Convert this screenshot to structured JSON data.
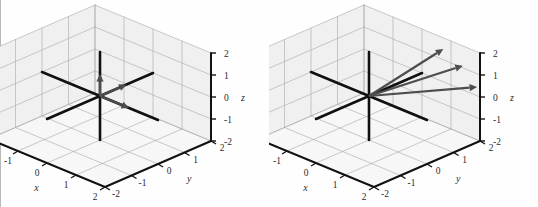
{
  "figure": {
    "background_color": "#fefefe",
    "panel_count": 2,
    "left_rule_color": "#b9b9b9"
  },
  "chart_data": [
    {
      "type": "scatter",
      "title": "",
      "subtitle": "",
      "projection": "3d",
      "panel_label": "left",
      "xlabel": "x",
      "ylabel": "y",
      "zlabel": "z",
      "xlim": [
        -2,
        2
      ],
      "ylim": [
        -2,
        2
      ],
      "zlim": [
        -2,
        2
      ],
      "xticks": [
        "-2",
        "-1",
        "0",
        "1",
        "2"
      ],
      "yticks": [
        "2",
        "1",
        "0",
        "-1",
        "-2"
      ],
      "zticks": [
        "2",
        "1",
        "0",
        "-1",
        "-2"
      ],
      "grid": true,
      "legend": "none",
      "axis_color": "#000000",
      "grid_color": "#b0b0b0",
      "pane_color": "#f0f0f0",
      "vector_color": "#4d4d4d",
      "axis_line_color": "#111111",
      "annotations": [
        "three short vectors drawn from the origin",
        "drawn axes lines for x, y and z through the origin"
      ],
      "vectors": [
        {
          "name": "vector-1",
          "start": [
            0,
            0,
            0
          ],
          "end": [
            0,
            0,
            1
          ],
          "label": ""
        },
        {
          "name": "vector-2",
          "start": [
            0,
            0,
            0
          ],
          "end": [
            0,
            1,
            0
          ],
          "label": ""
        },
        {
          "name": "vector-3",
          "start": [
            0,
            0,
            0
          ],
          "end": [
            1,
            0,
            0
          ],
          "label": ""
        }
      ],
      "axis_segments": [
        {
          "name": "x-axis-line",
          "from": [
            -2,
            0,
            0
          ],
          "to": [
            2,
            0,
            0
          ]
        },
        {
          "name": "y-axis-line",
          "from": [
            0,
            -2,
            0
          ],
          "to": [
            0,
            2,
            0
          ]
        },
        {
          "name": "z-axis-line",
          "from": [
            0,
            0,
            -2
          ],
          "to": [
            0,
            0,
            2
          ]
        }
      ]
    },
    {
      "type": "scatter",
      "title": "",
      "subtitle": "",
      "projection": "3d",
      "panel_label": "right",
      "xlabel": "x",
      "ylabel": "y",
      "zlabel": "z",
      "xlim": [
        -2,
        2
      ],
      "ylim": [
        -2,
        2
      ],
      "zlim": [
        -2,
        2
      ],
      "xticks": [
        "-2",
        "-1",
        "0",
        "1",
        "2"
      ],
      "yticks": [
        "2",
        "1",
        "0",
        "-1",
        "-2"
      ],
      "zticks": [
        "2",
        "1",
        "0",
        "-1",
        "-2"
      ],
      "grid": true,
      "legend": "none",
      "axis_color": "#000000",
      "grid_color": "#b0b0b0",
      "pane_color": "#f0f0f0",
      "vector_color": "#4d4d4d",
      "axis_line_color": "#111111",
      "annotations": [
        "three long vectors fanning out from the origin toward upper right",
        "drawn axes lines for x, y and z through the origin"
      ],
      "vectors": [
        {
          "name": "vector-1",
          "start": [
            0,
            0,
            0
          ],
          "end": [
            1.1,
            1.6,
            1.9
          ],
          "label": ""
        },
        {
          "name": "vector-2",
          "start": [
            0,
            0,
            0
          ],
          "end": [
            1.5,
            1.9,
            1.2
          ],
          "label": ""
        },
        {
          "name": "vector-3",
          "start": [
            0,
            0,
            0
          ],
          "end": [
            1.9,
            2.0,
            0.4
          ],
          "label": ""
        }
      ],
      "axis_segments": [
        {
          "name": "x-axis-line",
          "from": [
            -2,
            0,
            0
          ],
          "to": [
            2,
            0,
            0
          ]
        },
        {
          "name": "y-axis-line",
          "from": [
            0,
            -2,
            0
          ],
          "to": [
            0,
            2,
            0
          ]
        },
        {
          "name": "z-axis-line",
          "from": [
            0,
            0,
            -2
          ],
          "to": [
            0,
            0,
            2
          ]
        }
      ]
    }
  ],
  "panels": [
    {
      "id": "left-plot",
      "x_axis_label": "x",
      "y_axis_label": "y",
      "z_axis_label": "z",
      "x_tick_labels": [
        "-2",
        "-1",
        "0",
        "1",
        "2"
      ],
      "y_tick_labels": [
        "2",
        "1",
        "0",
        "-1",
        "-2"
      ],
      "z_tick_labels": [
        "2",
        "1",
        "0",
        "-1",
        "-2"
      ]
    },
    {
      "id": "right-plot",
      "x_axis_label": "x",
      "y_axis_label": "y",
      "z_axis_label": "z",
      "x_tick_labels": [
        "-2",
        "-1",
        "0",
        "1",
        "2"
      ],
      "y_tick_labels": [
        "2",
        "1",
        "0",
        "-1",
        "-2"
      ],
      "z_tick_labels": [
        "2",
        "1",
        "0",
        "-1",
        "-2"
      ]
    }
  ]
}
